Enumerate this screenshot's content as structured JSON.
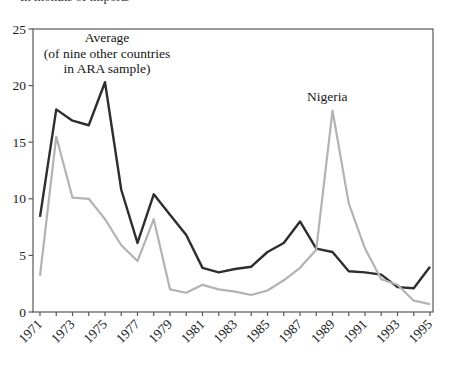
{
  "page": {
    "top_clipped_text": "In months of imports"
  },
  "chart_data": {
    "type": "line",
    "title": "",
    "xlabel": "",
    "ylabel": "",
    "x_years": [
      1971,
      1972,
      1973,
      1974,
      1975,
      1976,
      1977,
      1978,
      1979,
      1980,
      1981,
      1982,
      1983,
      1984,
      1985,
      1986,
      1987,
      1988,
      1989,
      1990,
      1991,
      1992,
      1993,
      1994,
      1995
    ],
    "x_tick_labels": [
      "1971",
      "1973",
      "1975",
      "1977",
      "1979",
      "1981",
      "1983",
      "1985",
      "1987",
      "1989",
      "1991",
      "1993",
      "1995"
    ],
    "y_ticks": [
      0,
      5,
      10,
      15,
      20,
      25
    ],
    "ylim": [
      0,
      25
    ],
    "xlim": [
      1971,
      1995
    ],
    "grid": false,
    "legend_position": "inline-annotations",
    "series": [
      {
        "name": "Average (of nine other countries in ARA sample)",
        "label_lines": [
          "Average",
          "(of nine other countries",
          "in ARA sample)"
        ],
        "color": "#2e2e2e",
        "stroke_width": 2.4,
        "values": [
          8.4,
          17.9,
          16.9,
          16.5,
          20.3,
          10.8,
          6.1,
          10.4,
          8.6,
          6.8,
          3.9,
          3.5,
          3.8,
          4.0,
          5.3,
          6.1,
          8.0,
          5.6,
          5.3,
          3.6,
          3.5,
          3.3,
          2.2,
          2.1,
          4.0
        ]
      },
      {
        "name": "Nigeria",
        "label": "Nigeria",
        "color": "#b3b3b3",
        "stroke_width": 2.2,
        "values": [
          3.2,
          15.5,
          10.1,
          10.0,
          8.2,
          5.9,
          4.5,
          8.2,
          2.0,
          1.7,
          2.4,
          2.0,
          1.8,
          1.5,
          1.9,
          2.8,
          3.9,
          5.5,
          17.8,
          9.6,
          5.6,
          2.9,
          2.4,
          1.0,
          0.7
        ]
      }
    ],
    "axis_color": "#59595b",
    "background": "#ffffff"
  }
}
